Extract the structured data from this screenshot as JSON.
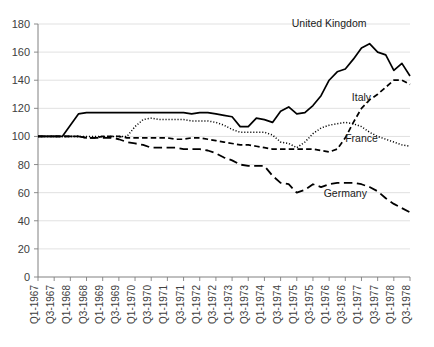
{
  "chart_data": {
    "type": "line",
    "title": "",
    "subtitle": "",
    "xlabel": "",
    "ylabel": "",
    "ylim": [
      0,
      180
    ],
    "ytick_step": 20,
    "yticks": [
      0,
      20,
      40,
      60,
      80,
      100,
      120,
      140,
      160,
      180
    ],
    "grid": true,
    "legend_position": "inline-annotations",
    "x_tick_labels": [
      "Q1-1967",
      "Q3-1967",
      "Q1-1968",
      "Q3-1968",
      "Q1-1969",
      "Q3-1969",
      "Q1-1970",
      "Q3-1970",
      "Q1-1971",
      "Q3-1971",
      "Q1-1972",
      "Q3-1972",
      "Q1-1973",
      "Q3-1973",
      "Q1-1974",
      "Q3-1974",
      "Q1-1975",
      "Q3-1975",
      "Q1-1976",
      "Q3-1976",
      "Q1-1977",
      "Q3-1977",
      "Q1-1978",
      "Q3-1978"
    ],
    "x": [
      "Q1-1967",
      "Q2-1967",
      "Q3-1967",
      "Q4-1967",
      "Q1-1968",
      "Q2-1968",
      "Q3-1968",
      "Q4-1968",
      "Q1-1969",
      "Q2-1969",
      "Q3-1969",
      "Q4-1969",
      "Q1-1970",
      "Q2-1970",
      "Q3-1970",
      "Q4-1970",
      "Q1-1971",
      "Q2-1971",
      "Q3-1971",
      "Q4-1971",
      "Q1-1972",
      "Q2-1972",
      "Q3-1972",
      "Q4-1972",
      "Q1-1973",
      "Q2-1973",
      "Q3-1973",
      "Q4-1973",
      "Q1-1974",
      "Q2-1974",
      "Q3-1974",
      "Q4-1974",
      "Q1-1975",
      "Q2-1975",
      "Q3-1975",
      "Q4-1975",
      "Q1-1976",
      "Q2-1976",
      "Q3-1976",
      "Q4-1976",
      "Q1-1977",
      "Q2-1977",
      "Q3-1977",
      "Q4-1977",
      "Q1-1978",
      "Q2-1978",
      "Q3-1978"
    ],
    "series": [
      {
        "name": "United Kingdom",
        "style": "solid",
        "label_x": "Q1-1976",
        "label_value": 178,
        "values": [
          100,
          100,
          100,
          100,
          108,
          116,
          117,
          117,
          117,
          117,
          117,
          117,
          117,
          117,
          117,
          117,
          117,
          117,
          117,
          116,
          117,
          117,
          116,
          115,
          114,
          107,
          107,
          113,
          112,
          110,
          118,
          121,
          116,
          117,
          122,
          129,
          140,
          146,
          148,
          155,
          163,
          166,
          160,
          158,
          147,
          152,
          143
        ]
      },
      {
        "name": "Italy",
        "style": "dashed",
        "label_x": "Q1-1977",
        "label_value": 125,
        "values": [
          100,
          100,
          100,
          100,
          100,
          100,
          99,
          99,
          100,
          100,
          100,
          99,
          99,
          99,
          99,
          99,
          99,
          98,
          98,
          99,
          99,
          98,
          97,
          96,
          95,
          94,
          94,
          93,
          92,
          91,
          91,
          91,
          91,
          91,
          91,
          90,
          89,
          91,
          99,
          110,
          120,
          126,
          130,
          135,
          140,
          140,
          137
        ]
      },
      {
        "name": "France",
        "style": "dotted",
        "label_x": "Q1-1977",
        "label_value": 96,
        "values": [
          100,
          100,
          100,
          100,
          100,
          100,
          100,
          100,
          100,
          100,
          100,
          100,
          107,
          112,
          113,
          112,
          112,
          112,
          112,
          111,
          111,
          111,
          110,
          108,
          105,
          103,
          103,
          103,
          103,
          101,
          96,
          95,
          92,
          96,
          102,
          106,
          108,
          109,
          110,
          109,
          107,
          103,
          100,
          98,
          96,
          94,
          93
        ]
      },
      {
        "name": "Germany",
        "style": "longdash",
        "label_x": "Q3-1976",
        "label_value": 57,
        "values": [
          100,
          100,
          100,
          100,
          100,
          100,
          99,
          99,
          99,
          99,
          98,
          96,
          95,
          94,
          92,
          92,
          92,
          92,
          91,
          91,
          91,
          90,
          88,
          85,
          83,
          80,
          79,
          79,
          79,
          72,
          67,
          66,
          60,
          62,
          66,
          64,
          66,
          67,
          67,
          67,
          66,
          64,
          61,
          56,
          52,
          49,
          46
        ]
      }
    ]
  }
}
